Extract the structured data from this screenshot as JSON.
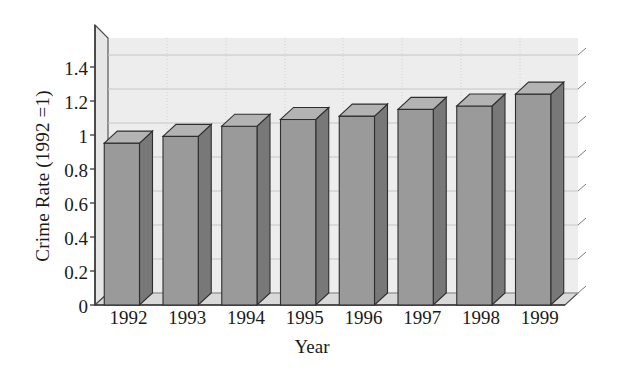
{
  "chart_data": {
    "type": "bar",
    "title": "",
    "xlabel": "Year",
    "ylabel": "Crime Rate (1992 =1)",
    "categories": [
      "1992",
      "1993",
      "1994",
      "1995",
      "1996",
      "1997",
      "1998",
      "1999"
    ],
    "values": [
      0.96,
      1.0,
      1.06,
      1.1,
      1.12,
      1.16,
      1.18,
      1.25
    ],
    "series": [
      {
        "name": "Crime Rate",
        "values": [
          0.96,
          1.0,
          1.06,
          1.1,
          1.12,
          1.16,
          1.18,
          1.25
        ]
      }
    ],
    "ylim": [
      0,
      1.5
    ],
    "yticks": [
      "0",
      "0.2",
      "0.4",
      "0.6",
      "0.8",
      "1",
      "1.2",
      "1.4"
    ],
    "ytick_values": [
      0,
      0.2,
      0.4,
      0.6,
      0.8,
      1,
      1.2,
      1.4
    ],
    "grid": true,
    "legend": "none",
    "style": "3d-column",
    "colors": {
      "bar_front": "#9a9a9a",
      "bar_side": "#787878",
      "bar_top": "#b3b3b3",
      "plot_background": "#ededed",
      "floor": "#d9d9d9",
      "gridline": "#c9c9c9",
      "axis_line": "#555555",
      "text": "#1a1a1a",
      "page_background": "#ffffff"
    }
  },
  "axes": {
    "y_title": "Crime Rate (1992 =1)",
    "x_title": "Year",
    "y_tick_labels": [
      "1.4",
      "1.2",
      "1",
      "0.8",
      "0.6",
      "0.4",
      "0.2",
      "0"
    ],
    "x_tick_labels": [
      "1992",
      "1993",
      "1994",
      "1995",
      "1996",
      "1997",
      "1998",
      "1999"
    ]
  }
}
